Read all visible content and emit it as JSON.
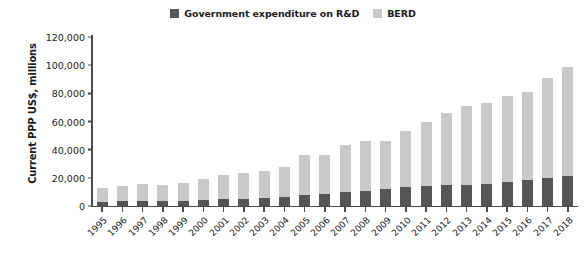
{
  "chart_data": {
    "type": "bar",
    "stacked": true,
    "title": "",
    "xlabel": "",
    "ylabel": "Current PPP US$, millions",
    "ylim": [
      0,
      120000
    ],
    "ytick_labels": [
      "120,000",
      "100,000",
      "80,000",
      "60,000",
      "40,000",
      "20,000",
      "0"
    ],
    "ytick_values": [
      120000,
      100000,
      80000,
      60000,
      40000,
      20000,
      0
    ],
    "grid": false,
    "legend_position": "top-center",
    "categories": [
      "1995",
      "1996",
      "1997",
      "1998",
      "1999",
      "2000",
      "2001",
      "2002",
      "2003",
      "2004",
      "2005",
      "2006",
      "2007",
      "2008",
      "2009",
      "2010",
      "2011",
      "2012",
      "2013",
      "2014",
      "2015",
      "2016",
      "2017",
      "2018"
    ],
    "series": [
      {
        "name": "Government expenditure on R&D",
        "color": "#555555",
        "values": [
          3200,
          3400,
          3600,
          3700,
          3900,
          4200,
          4700,
          5200,
          5600,
          6400,
          7600,
          8300,
          9600,
          11000,
          12300,
          13800,
          14200,
          14600,
          15100,
          15600,
          16800,
          18600,
          19800,
          21000
        ]
      },
      {
        "name": "BERD",
        "color": "#c9c9c9",
        "values": [
          9800,
          10600,
          11900,
          11300,
          12600,
          15300,
          17100,
          18300,
          19400,
          21600,
          28400,
          27700,
          33400,
          35000,
          33700,
          39200,
          45800,
          51400,
          55900,
          57700,
          61200,
          62400,
          71200,
          78000
        ]
      }
    ],
    "totals": [
      13000,
      14000,
      15500,
      15000,
      16500,
      19500,
      21800,
      23500,
      25000,
      28000,
      36000,
      36000,
      43000,
      46000,
      46000,
      53000,
      60000,
      66000,
      71000,
      73300,
      78000,
      81000,
      91000,
      99000
    ]
  }
}
